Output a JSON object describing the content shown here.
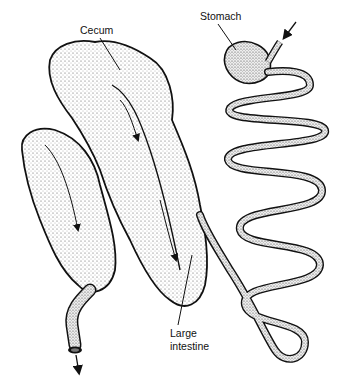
{
  "diagram": {
    "labels": {
      "cecum": "Cecum",
      "stomach": "Stomach",
      "large_intestine_line1": "Large",
      "large_intestine_line2": "intestine"
    },
    "arrows": {
      "entry": "arrow into stomach (top right)",
      "exit": "arrow out of large intestine (bottom left)"
    },
    "colors": {
      "ink": "#111111",
      "stipple": "#555555",
      "background": "#ffffff"
    }
  }
}
